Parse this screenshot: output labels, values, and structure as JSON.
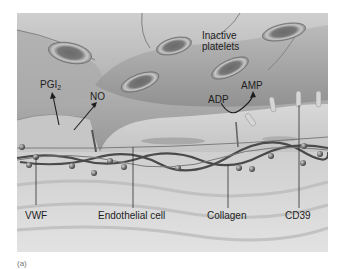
{
  "figure": {
    "caption": "(a)",
    "labels": {
      "inactive_platelets_line1": "Inactive",
      "inactive_platelets_line2": "platelets",
      "pgi2_main": "PGI",
      "pgi2_sub": "2",
      "no": "NO",
      "adp": "ADP",
      "amp": "AMP",
      "vwf": "VWF",
      "endothelial_cell": "Endothelial cell",
      "collagen": "Collagen",
      "cd39": "CD39"
    },
    "colors": {
      "lumen_dark": "#6e6e6e",
      "lumen_light": "#bdbdbd",
      "endothelium": "#c9c9c9",
      "platelet_rim": "#8a8a8a",
      "platelet_center": "#5a5a5a",
      "subendothelium": "#d6d6d6",
      "fiber": "#4a4a4a",
      "label_text": "#1e1e1e"
    }
  }
}
